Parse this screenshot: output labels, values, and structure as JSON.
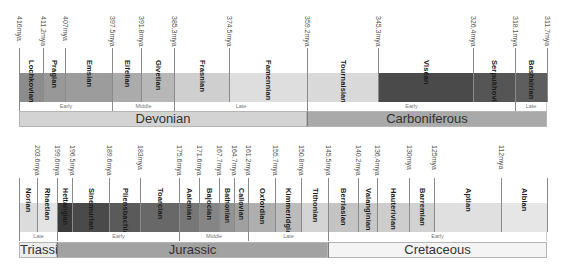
{
  "top_timeline": {
    "ticks": [
      {
        "label": "416mya"
      },
      {
        "label": "411.2mya"
      },
      {
        "label": "407mya"
      },
      {
        "label": "397.5mya"
      },
      {
        "label": "391.8mya"
      },
      {
        "label": "385.3mya"
      },
      {
        "label": "374.5mya"
      },
      {
        "label": "359.2mya"
      },
      {
        "label": "345.3mya"
      },
      {
        "label": "326.4mya"
      },
      {
        "label": "318.1mya"
      },
      {
        "label": "311.7mya"
      }
    ],
    "stages": [
      {
        "name": "Lochkovian",
        "color": "#8c8c8c"
      },
      {
        "name": "Pragian",
        "color": "#989898"
      },
      {
        "name": "Emsian",
        "color": "#9c9c9c"
      },
      {
        "name": "Eifelian",
        "color": "#ababab"
      },
      {
        "name": "Givetian",
        "color": "#b7b7b7"
      },
      {
        "name": "Frasnian",
        "color": "#cfcfcf"
      },
      {
        "name": "Famennian",
        "color": "#dedede"
      },
      {
        "name": "Tournaisian",
        "color": "#d9d9d9"
      },
      {
        "name": "Viséan",
        "color": "#4a4a4a"
      },
      {
        "name": "Serpukhovian",
        "color": "#555555"
      },
      {
        "name": "Bashkirian",
        "color": "#5e5e5e"
      }
    ],
    "subepochs": [
      {
        "name": "Early"
      },
      {
        "name": "Middle"
      },
      {
        "name": "Late"
      },
      {
        "name": "Early"
      },
      {
        "name": "Late"
      }
    ],
    "periods": [
      {
        "name": "Devonian",
        "color": "#d3d3d3"
      },
      {
        "name": "Carboniferous",
        "color": "#a9a9a9"
      }
    ]
  },
  "bottom_timeline": {
    "ticks": [
      {
        "label": ""
      },
      {
        "label": "203.6mya"
      },
      {
        "label": "199.6mya"
      },
      {
        "label": "196.5mya"
      },
      {
        "label": "189.6mya"
      },
      {
        "label": "183mya"
      },
      {
        "label": "175.6mya"
      },
      {
        "label": "171.6mya"
      },
      {
        "label": "167.7mya"
      },
      {
        "label": "164.7mya"
      },
      {
        "label": "161.2mya"
      },
      {
        "label": "155.7mya"
      },
      {
        "label": "150.8mya"
      },
      {
        "label": "145.5mya"
      },
      {
        "label": "140.2mya"
      },
      {
        "label": "136.4mya"
      },
      {
        "label": "130mya"
      },
      {
        "label": "125mya"
      },
      {
        "label": "112mya"
      }
    ],
    "stages": [
      {
        "name": "Norian",
        "color": "#dcdcdc"
      },
      {
        "name": "Rhaetian",
        "color": "#e4e4e4"
      },
      {
        "name": "Hettangian",
        "color": "#3a3a3a"
      },
      {
        "name": "Sinemurian",
        "color": "#4a4a4a"
      },
      {
        "name": "Pliensbachian",
        "color": "#5a5a5a"
      },
      {
        "name": "Toarcian",
        "color": "#686868"
      },
      {
        "name": "Aalenian",
        "color": "#777777"
      },
      {
        "name": "Bajocian",
        "color": "#858585"
      },
      {
        "name": "Bathonian",
        "color": "#939393"
      },
      {
        "name": "Callovian",
        "color": "#a0a0a0"
      },
      {
        "name": "Oxfordian",
        "color": "#afafaf"
      },
      {
        "name": "Kimmeridgian",
        "color": "#bcbcbc"
      },
      {
        "name": "Tithonian",
        "color": "#d4d4d4"
      },
      {
        "name": "Berriasian",
        "color": "#c4c4c4"
      },
      {
        "name": "Valanginian",
        "color": "#c8c8c8"
      },
      {
        "name": "Hauterivian",
        "color": "#cdcdcd"
      },
      {
        "name": "Barremian",
        "color": "#d2d2d2"
      },
      {
        "name": "Aptian",
        "color": "#e0e0e0"
      },
      {
        "name": "Albian",
        "color": "#e6e6e6"
      }
    ],
    "subepochs": [
      {
        "name": "Late"
      },
      {
        "name": "Early"
      },
      {
        "name": "Middle"
      },
      {
        "name": "Late"
      },
      {
        "name": "Early"
      }
    ],
    "periods": [
      {
        "name": "Triassic",
        "color": "#ececec"
      },
      {
        "name": "Jurassic",
        "color": "#a2a2a2"
      },
      {
        "name": "Cretaceous",
        "color": "#f4f4f4"
      }
    ]
  }
}
